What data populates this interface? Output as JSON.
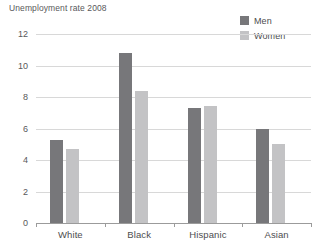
{
  "chart_data": {
    "type": "bar",
    "title": "Unemployment rate 2008",
    "xlabel": "",
    "ylabel": "Unemployment rate 2008",
    "categories": [
      "White",
      "Black",
      "Hispanic",
      "Asian"
    ],
    "series": [
      {
        "name": "Men",
        "color": "#77777a",
        "values": [
          5.3,
          10.8,
          7.3,
          6.0
        ]
      },
      {
        "name": "Women",
        "color": "#c3c3c5",
        "values": [
          4.7,
          8.4,
          7.4,
          5.0
        ]
      }
    ],
    "ylim": [
      0,
      12
    ],
    "yticks": [
      0,
      2,
      4,
      6,
      8,
      10,
      12
    ],
    "ytick_labels": [
      "0",
      "2",
      "4",
      "6",
      "8",
      "10",
      "12"
    ],
    "grid": true,
    "legend_position": "top-right"
  },
  "legend": {
    "items": [
      {
        "label": "Men"
      },
      {
        "label": "Women"
      }
    ]
  },
  "colors": {
    "men": "#77777a",
    "women": "#c3c3c5",
    "gridline": "#d8d8d8",
    "axis": "#9b9b9b",
    "text": "#58585a"
  }
}
